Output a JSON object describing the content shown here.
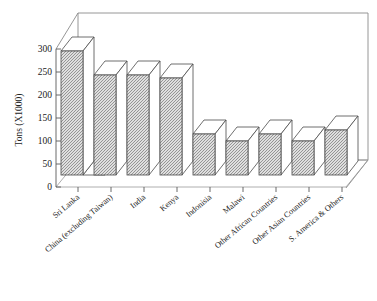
{
  "chart_data": {
    "type": "bar",
    "title": "",
    "xlabel": "",
    "ylabel": "Tons (X1000)",
    "ylim": [
      0,
      300
    ],
    "ytick_values": [
      0,
      50,
      100,
      150,
      200,
      250,
      300
    ],
    "ytick_labels": [
      "0",
      "50",
      "100",
      "150",
      "200",
      "250",
      "300"
    ],
    "grid": false,
    "legend": "none",
    "three_d": true,
    "categories": [
      "Sri Lanka",
      "China (excluding Taiwan)",
      "India",
      "Kenya",
      "Indonisia",
      "Malawi",
      "Other African Countries",
      "Other Asian Countries",
      "S. America & Others"
    ],
    "values": [
      285,
      228,
      228,
      222,
      95,
      78,
      95,
      78,
      102
    ],
    "series": [
      {
        "name": "Tons (X1000)",
        "values": [
          285,
          228,
          228,
          222,
          95,
          78,
          95,
          78,
          102
        ]
      }
    ],
    "colors": {
      "bar_fill": "#b3b3b3",
      "bar_top": "#ffffff",
      "bar_outline": "#4a4a4a",
      "axis": "#5a5a5a",
      "frame": "#8a8a8a",
      "text": "#222222",
      "background": "#ffffff"
    }
  },
  "axis": {
    "y_title": "Tons (X1000)"
  }
}
